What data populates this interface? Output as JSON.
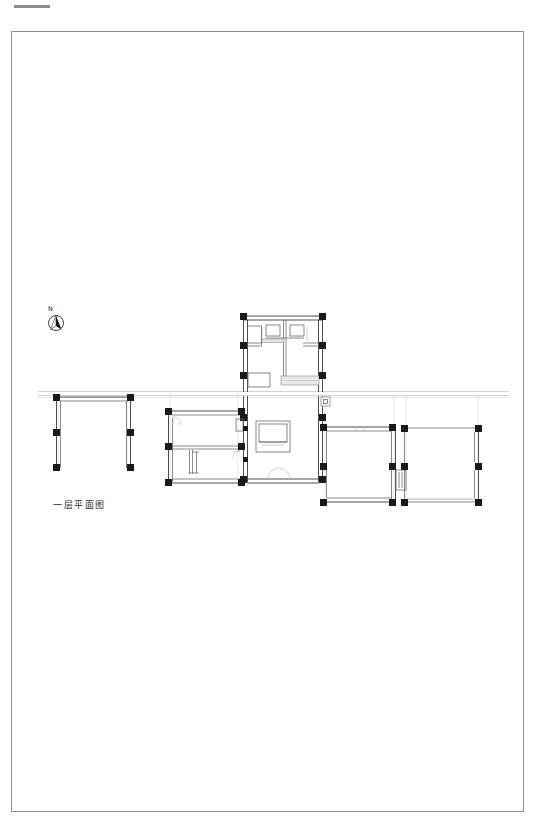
{
  "sheet": {
    "width": 547,
    "height": 838,
    "background": "#ffffff",
    "frame": {
      "x": 11,
      "y": 31,
      "width": 513,
      "height": 781,
      "stroke": "#8f8f8f"
    },
    "corner_tick": {
      "label": "corner-rule-mark",
      "color": "#8c8c8c"
    }
  },
  "annotations": {
    "north_label": "N",
    "plan_caption": "一层平面图",
    "detail_marker": "section-reference-marker"
  },
  "colors": {
    "column_fill": "#1a1a1a",
    "wall_stroke": "#3a3a3a",
    "thin_wall_stroke": "#5a5a5a",
    "guide_stroke": "#b9b9b9",
    "furniture_stroke": "#6a6a6a",
    "frame_stroke": "#8f8f8f",
    "paper": "#ffffff"
  },
  "drawing": {
    "type": "architectural-floor-plan",
    "title": "一层平面图",
    "scale_note": "",
    "orientation": "north-up-left-tilt",
    "blocks": [
      {
        "name": "west-pavilion",
        "label": "west-open-pavilion",
        "x": 53,
        "y": 396,
        "width": 79,
        "height": 74,
        "open_side": "south",
        "columns": 6
      },
      {
        "name": "west-wing",
        "label": "west-wing-rooms",
        "x": 165,
        "y": 411,
        "width": 78,
        "height": 72,
        "columns": 6
      },
      {
        "name": "central-core",
        "label": "central-core-hall",
        "x": 241,
        "y": 313,
        "width": 84,
        "height": 169,
        "columns": 8
      },
      {
        "name": "east-room",
        "label": "east-square-room",
        "x": 320,
        "y": 426,
        "width": 73,
        "height": 77,
        "columns": 6
      },
      {
        "name": "far-east-room",
        "label": "far-east-room",
        "x": 401,
        "y": 426,
        "width": 77,
        "height": 77,
        "columns": 6
      }
    ],
    "site_line": {
      "name": "site-boundary-line",
      "y": 393,
      "x_start": 38,
      "x_end": 509
    },
    "courtyard_feature": {
      "name": "central-courtyard-pool",
      "x": 256,
      "y": 421,
      "width": 34,
      "height": 31
    }
  }
}
